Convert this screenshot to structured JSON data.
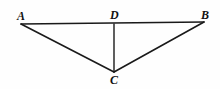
{
  "figure": {
    "background_color": "#fefefe",
    "stroke_color": "#1a1a1a",
    "label_color": "#111111",
    "width": 220,
    "height": 89,
    "points": {
      "A": {
        "label": "A",
        "x": 21,
        "y": 24,
        "label_x": 17,
        "label_y": 10
      },
      "B": {
        "label": "B",
        "x": 204,
        "y": 22,
        "label_x": 201,
        "label_y": 9
      },
      "C": {
        "label": "C",
        "x": 114,
        "y": 72,
        "label_x": 110,
        "label_y": 74
      },
      "D": {
        "label": "D",
        "x": 114,
        "y": 24,
        "label_x": 110,
        "label_y": 9
      }
    },
    "segments": [
      {
        "name": "segment-AB",
        "from": "A",
        "to": "B"
      },
      {
        "name": "segment-AC",
        "from": "A",
        "to": "C"
      },
      {
        "name": "segment-CB",
        "from": "C",
        "to": "B"
      },
      {
        "name": "segment-DC",
        "from": "D",
        "to": "C"
      }
    ]
  }
}
